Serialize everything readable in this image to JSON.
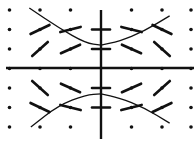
{
  "diagram": {
    "title": "",
    "type": "slope-field",
    "colors": {
      "ink": "#111111",
      "background": "#ffffff"
    },
    "grid": {
      "x_values": [
        -3,
        -2,
        -1,
        0,
        1,
        2,
        3
      ],
      "y_values": [
        3,
        2,
        1,
        0,
        -1,
        -2,
        -3
      ]
    },
    "segments": [
      {
        "x": -2,
        "y": 2,
        "slope": 0.75
      },
      {
        "x": -1,
        "y": 2,
        "slope": 0.4
      },
      {
        "x": 0,
        "y": 2,
        "slope": 0
      },
      {
        "x": 1,
        "y": 2,
        "slope": -0.4
      },
      {
        "x": 2,
        "y": 2,
        "slope": -0.75
      },
      {
        "x": -2,
        "y": 1,
        "slope": 1.4
      },
      {
        "x": -1,
        "y": 1,
        "slope": 0.7
      },
      {
        "x": 0,
        "y": 1,
        "slope": 0
      },
      {
        "x": 1,
        "y": 1,
        "slope": -0.7
      },
      {
        "x": 2,
        "y": 1,
        "slope": -1.4
      },
      {
        "x": -2,
        "y": -1,
        "slope": -1.4
      },
      {
        "x": -1,
        "y": -1,
        "slope": -0.7
      },
      {
        "x": 0,
        "y": -1,
        "slope": 0
      },
      {
        "x": 1,
        "y": -1,
        "slope": 0.7
      },
      {
        "x": 2,
        "y": -1,
        "slope": 1.4
      },
      {
        "x": -2,
        "y": -2,
        "slope": -0.75
      },
      {
        "x": -1,
        "y": -2,
        "slope": -0.4
      },
      {
        "x": 0,
        "y": -2,
        "slope": 0
      },
      {
        "x": 1,
        "y": -2,
        "slope": 0.4
      },
      {
        "x": 2,
        "y": -2,
        "slope": 0.75
      }
    ],
    "curves": [
      {
        "name": "upper-left-solution",
        "points": [
          [
            -2.35,
            3.1
          ],
          [
            -1.4,
            2.1
          ],
          [
            -0.5,
            1.3
          ],
          [
            0,
            1.2
          ]
        ]
      },
      {
        "name": "upper-right-solution",
        "points": [
          [
            0,
            1.2
          ],
          [
            0.6,
            1.4
          ],
          [
            1.4,
            1.9
          ],
          [
            2.25,
            2.7
          ]
        ]
      },
      {
        "name": "lower-left-solution",
        "points": [
          [
            -2.3,
            -3.0
          ],
          [
            -1.4,
            -1.9
          ],
          [
            -0.5,
            -1.35
          ],
          [
            0,
            -1.3
          ]
        ]
      },
      {
        "name": "lower-right-solution",
        "points": [
          [
            0,
            -1.3
          ],
          [
            0.6,
            -1.5
          ],
          [
            1.4,
            -2.0
          ],
          [
            2.25,
            -2.8
          ]
        ]
      }
    ]
  }
}
